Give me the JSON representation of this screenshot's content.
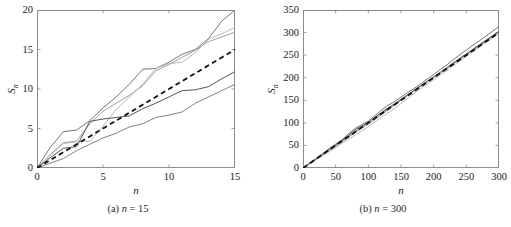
{
  "figure": {
    "background": "#ffffff",
    "panels": [
      {
        "id": "a",
        "caption_prefix": "(a)",
        "caption_var": "n",
        "caption_eq": "= 15"
      },
      {
        "id": "b",
        "caption_prefix": "(b)",
        "caption_var": "n",
        "caption_eq": "= 300"
      }
    ]
  },
  "chart_data": [
    {
      "type": "line",
      "panel": "a",
      "title": "(a) n = 15",
      "xlabel": "n",
      "ylabel": "S_n",
      "xlim": [
        0,
        15
      ],
      "ylim": [
        0,
        20
      ],
      "xticks": [
        0,
        5,
        10,
        15
      ],
      "yticks": [
        0,
        5,
        10,
        15,
        20
      ],
      "grid": false,
      "legend": "none",
      "axis_color": "#8c8c8c",
      "x": [
        0,
        1,
        2,
        3,
        4,
        5,
        6,
        7,
        8,
        9,
        10,
        11,
        12,
        13,
        14,
        15
      ],
      "series": [
        {
          "name": "trajectory-1",
          "color": "#6e6e6e",
          "style": "solid",
          "values": [
            0,
            2.6,
            4.6,
            4.8,
            6.0,
            7.6,
            9.0,
            10.6,
            12.5,
            12.6,
            13.4,
            14.4,
            15.0,
            16.4,
            18.6,
            20.0
          ]
        },
        {
          "name": "trajectory-2",
          "color": "#9a9a9a",
          "style": "solid",
          "values": [
            0,
            1.7,
            3.2,
            3.4,
            5.6,
            7.2,
            8.2,
            9.2,
            10.4,
            12.3,
            13.1,
            14.0,
            14.9,
            16.0,
            16.6,
            17.2
          ]
        },
        {
          "name": "trajectory-3",
          "color": "#b5b5b5",
          "style": "solid",
          "values": [
            0,
            1.6,
            3.1,
            3.3,
            3.4,
            5.3,
            7.4,
            9.0,
            10.6,
            12.6,
            13.2,
            13.4,
            14.6,
            16.3,
            17.0,
            17.8
          ]
        },
        {
          "name": "trajectory-4",
          "color": "#4a4a4a",
          "style": "solid",
          "values": [
            0,
            1.3,
            2.5,
            2.7,
            5.9,
            6.2,
            6.4,
            6.6,
            7.5,
            8.2,
            9.0,
            9.8,
            9.9,
            10.3,
            11.3,
            12.2
          ]
        },
        {
          "name": "trajectory-5",
          "color": "#7a7a7a",
          "style": "solid",
          "values": [
            0,
            0.6,
            1.2,
            2.2,
            3.0,
            3.8,
            4.4,
            5.2,
            5.6,
            6.4,
            6.7,
            7.1,
            8.2,
            9.0,
            9.8,
            10.6
          ]
        },
        {
          "name": "mean-reference",
          "color": "#111111",
          "style": "dashed",
          "values": [
            0,
            1,
            2,
            3,
            4,
            5,
            6,
            7,
            8,
            9,
            10,
            11,
            12,
            13,
            14,
            15
          ]
        }
      ]
    },
    {
      "type": "line",
      "panel": "b",
      "title": "(b) n = 300",
      "xlabel": "n",
      "ylabel": "S_n",
      "xlim": [
        0,
        300
      ],
      "ylim": [
        0,
        350
      ],
      "xticks": [
        0,
        50,
        100,
        150,
        200,
        250,
        300
      ],
      "yticks": [
        0,
        50,
        100,
        150,
        200,
        250,
        300,
        350
      ],
      "grid": false,
      "legend": "none",
      "axis_color": "#8c8c8c",
      "x": [
        0,
        10,
        20,
        30,
        40,
        50,
        60,
        70,
        80,
        90,
        100,
        110,
        120,
        130,
        140,
        150,
        160,
        170,
        180,
        190,
        200,
        210,
        220,
        230,
        240,
        250,
        260,
        270,
        280,
        290,
        300
      ],
      "series": [
        {
          "name": "trajectory-1",
          "color": "#6e6e6e",
          "style": "solid",
          "values": [
            0,
            11,
            21,
            32,
            43,
            53,
            63,
            76,
            88,
            96,
            104,
            116,
            128,
            139,
            147,
            157,
            167,
            176,
            186,
            197,
            207,
            218,
            228,
            240,
            251,
            261,
            272,
            282,
            292,
            303,
            313
          ]
        },
        {
          "name": "trajectory-2",
          "color": "#9a9a9a",
          "style": "solid",
          "values": [
            0,
            9,
            19,
            29,
            39,
            48,
            58,
            69,
            79,
            88,
            97,
            107,
            118,
            129,
            139,
            150,
            161,
            172,
            182,
            192,
            201,
            211,
            221,
            232,
            242,
            252,
            262,
            272,
            282,
            292,
            302
          ]
        },
        {
          "name": "trajectory-3",
          "color": "#b5b5b5",
          "style": "solid",
          "values": [
            0,
            9,
            18,
            27,
            36,
            45,
            55,
            64,
            73,
            82,
            92,
            102,
            112,
            122,
            132,
            143,
            154,
            165,
            176,
            186,
            196,
            206,
            216,
            227,
            237,
            247,
            257,
            268,
            278,
            288,
            298
          ]
        },
        {
          "name": "trajectory-4",
          "color": "#4a4a4a",
          "style": "solid",
          "values": [
            0,
            10,
            20,
            31,
            41,
            51,
            61,
            73,
            85,
            93,
            101,
            112,
            123,
            133,
            142,
            152,
            162,
            172,
            182,
            192,
            202,
            212,
            222,
            233,
            243,
            253,
            263,
            273,
            283,
            293,
            303
          ]
        },
        {
          "name": "trajectory-5",
          "color": "#7a7a7a",
          "style": "solid",
          "values": [
            0,
            10,
            20,
            30,
            40,
            50,
            60,
            70,
            81,
            91,
            101,
            111,
            121,
            131,
            141,
            151,
            161,
            171,
            181,
            191,
            201,
            211,
            221,
            231,
            241,
            251,
            261,
            271,
            281,
            291,
            301
          ]
        },
        {
          "name": "mean-reference",
          "color": "#111111",
          "style": "dashed",
          "values": [
            0,
            10,
            20,
            30,
            40,
            50,
            60,
            70,
            80,
            90,
            100,
            110,
            120,
            130,
            140,
            150,
            160,
            170,
            180,
            190,
            200,
            210,
            220,
            230,
            240,
            250,
            260,
            270,
            280,
            290,
            300
          ]
        }
      ]
    }
  ]
}
